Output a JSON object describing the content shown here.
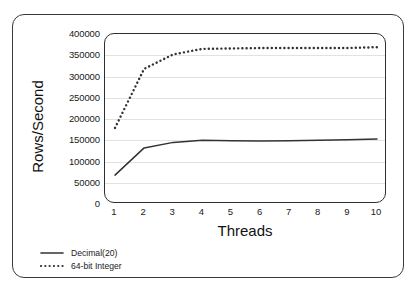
{
  "chart_data": {
    "type": "line",
    "title": "",
    "subtitle": "",
    "xlabel": "Threads",
    "ylabel": "Rows/Second",
    "x": [
      1,
      2,
      3,
      4,
      5,
      6,
      7,
      8,
      9,
      10
    ],
    "xtick_labels": [
      "1",
      "2",
      "3",
      "4",
      "5",
      "6",
      "7",
      "8",
      "9",
      "10"
    ],
    "ytick_labels": [
      "0",
      "50000",
      "100000",
      "150000",
      "200000",
      "250000",
      "300000",
      "350000",
      "400000"
    ],
    "ytick_values": [
      0,
      50000,
      100000,
      150000,
      200000,
      250000,
      300000,
      350000,
      400000
    ],
    "xlim": [
      1,
      10
    ],
    "ylim": [
      0,
      400000
    ],
    "grid": "horizontal",
    "legend_position": "below-left-outside",
    "series": [
      {
        "name": "Decimal(20)",
        "style": "solid",
        "color": "#333333",
        "values": [
          68000,
          132000,
          145000,
          150000,
          149000,
          148000,
          149000,
          150000,
          151000,
          153000
        ]
      },
      {
        "name": "64-bit Integer",
        "style": "dotted",
        "color": "#333333",
        "values": [
          179000,
          318000,
          352000,
          365000,
          366000,
          367000,
          367000,
          367000,
          367000,
          369000
        ]
      }
    ]
  },
  "legend": {
    "items": [
      {
        "label": "Decimal(20)",
        "style": "solid"
      },
      {
        "label": "64-bit Integer",
        "style": "dotted"
      }
    ]
  }
}
